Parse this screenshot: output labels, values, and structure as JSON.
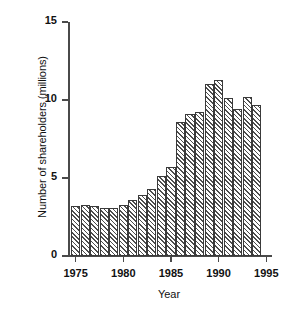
{
  "chart_data": {
    "type": "bar",
    "title": "",
    "xlabel": "Year",
    "ylabel": "Number of shareholders (millions)",
    "categories": [
      1975,
      1976,
      1977,
      1978,
      1979,
      1980,
      1981,
      1982,
      1983,
      1984,
      1985,
      1986,
      1987,
      1988,
      1989,
      1990,
      1991,
      1992,
      1993,
      1994
    ],
    "values": [
      3.2,
      3.3,
      3.2,
      3.1,
      3.1,
      3.3,
      3.6,
      3.9,
      4.3,
      5.1,
      5.7,
      8.6,
      9.1,
      9.2,
      11.0,
      11.3,
      10.1,
      9.4,
      10.2,
      9.7
    ],
    "series": [
      {
        "name": "Number of shareholders (millions)",
        "values": [
          3.2,
          3.3,
          3.2,
          3.1,
          3.1,
          3.3,
          3.6,
          3.9,
          4.3,
          5.1,
          5.7,
          8.6,
          9.1,
          9.2,
          11.0,
          11.3,
          10.1,
          9.4,
          10.2,
          9.7
        ]
      }
    ],
    "ylim": [
      0,
      15
    ],
    "xlim": [
      1974.2,
      1995.6
    ],
    "ytick_labels": [
      "0",
      "5",
      "10",
      "15"
    ],
    "ytick_values": [
      0,
      5,
      10,
      15
    ],
    "xtick_labels": [
      "1975",
      "1980",
      "1985",
      "1990",
      "1995"
    ],
    "xtick_values": [
      1975,
      1980,
      1985,
      1990,
      1995
    ],
    "grid": false,
    "legend": null,
    "bar_style": {
      "fill": "diagonal-hatch",
      "hatch_color": "#4d4d4d",
      "background": "#ffffff",
      "edge_color": "#3a3a3a"
    },
    "axis_color": "#4a4a4a"
  }
}
